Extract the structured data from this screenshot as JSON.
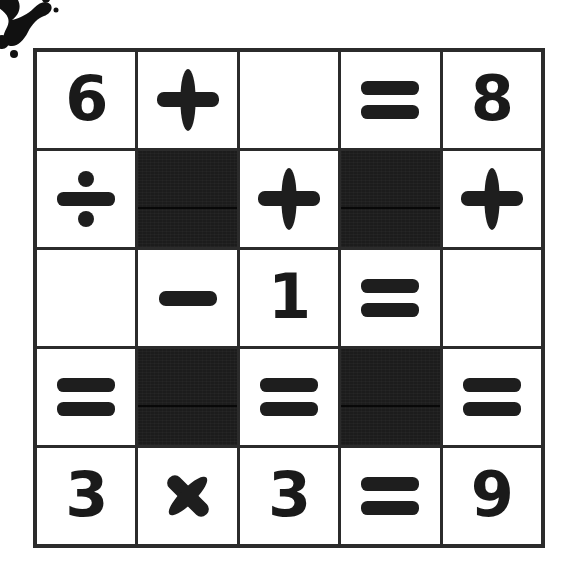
{
  "page": {
    "background_color": "#ffffff",
    "ink_color": "#1a1a1a",
    "grid_line_color": "#2b2b2b",
    "blocked_cell_color": "#1c1c1c"
  },
  "decoration": {
    "name": "ink-splatter",
    "label": "ink splatter",
    "color": "#111111",
    "position": "top-left"
  },
  "grid": {
    "rows": 5,
    "columns": 5,
    "cells": [
      [
        {
          "type": "digit",
          "value": "6",
          "icon": "digit-six"
        },
        {
          "type": "operator",
          "value": "+",
          "icon": "plus-icon"
        },
        {
          "type": "empty",
          "value": "",
          "icon": "blank-cell"
        },
        {
          "type": "operator",
          "value": "=",
          "icon": "equals-icon"
        },
        {
          "type": "digit",
          "value": "8",
          "icon": "digit-eight"
        }
      ],
      [
        {
          "type": "operator",
          "value": "÷",
          "icon": "divide-icon"
        },
        {
          "type": "blocked",
          "value": "",
          "icon": "blocked-cell"
        },
        {
          "type": "operator",
          "value": "+",
          "icon": "plus-icon"
        },
        {
          "type": "blocked",
          "value": "",
          "icon": "blocked-cell"
        },
        {
          "type": "operator",
          "value": "+",
          "icon": "plus-icon"
        }
      ],
      [
        {
          "type": "empty",
          "value": "",
          "icon": "blank-cell"
        },
        {
          "type": "operator",
          "value": "−",
          "icon": "minus-icon"
        },
        {
          "type": "digit",
          "value": "1",
          "icon": "digit-one"
        },
        {
          "type": "operator",
          "value": "=",
          "icon": "equals-icon"
        },
        {
          "type": "empty",
          "value": "",
          "icon": "blank-cell"
        }
      ],
      [
        {
          "type": "operator",
          "value": "=",
          "icon": "equals-icon"
        },
        {
          "type": "blocked",
          "value": "",
          "icon": "blocked-cell"
        },
        {
          "type": "operator",
          "value": "=",
          "icon": "equals-icon"
        },
        {
          "type": "blocked",
          "value": "",
          "icon": "blocked-cell"
        },
        {
          "type": "operator",
          "value": "=",
          "icon": "equals-icon"
        }
      ],
      [
        {
          "type": "digit",
          "value": "3",
          "icon": "digit-three"
        },
        {
          "type": "operator",
          "value": "×",
          "icon": "multiply-icon"
        },
        {
          "type": "digit",
          "value": "3",
          "icon": "digit-three"
        },
        {
          "type": "operator",
          "value": "=",
          "icon": "equals-icon"
        },
        {
          "type": "digit",
          "value": "9",
          "icon": "digit-nine"
        }
      ]
    ]
  },
  "equations": {
    "across": [
      "6 + _ = 8",
      "_ - 1 = _",
      "3 x 3 = 9"
    ],
    "down": [
      "6 ÷ _ = 3",
      "+ - x",
      "_ + 1 = 3",
      "= = =",
      "8 + _ = 9"
    ]
  }
}
